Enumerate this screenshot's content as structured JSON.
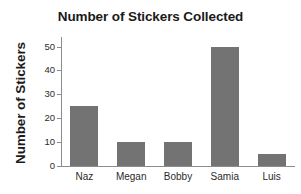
{
  "chart_data": {
    "type": "bar",
    "title": "Number of Stickers Collected",
    "xlabel": "",
    "ylabel": "Number of Stickers",
    "categories": [
      "Naz",
      "Megan",
      "Bobby",
      "Samia",
      "Luis"
    ],
    "values": [
      25,
      10,
      10,
      50,
      5
    ],
    "yticks": [
      0,
      10,
      20,
      30,
      40,
      50
    ],
    "ylim": [
      0,
      54
    ],
    "grid": false,
    "legend": null,
    "bar_color": "#737373",
    "axis_color": "#8c8c8c",
    "background_color": "#ffffff",
    "text_color": "#1a1a1a"
  }
}
